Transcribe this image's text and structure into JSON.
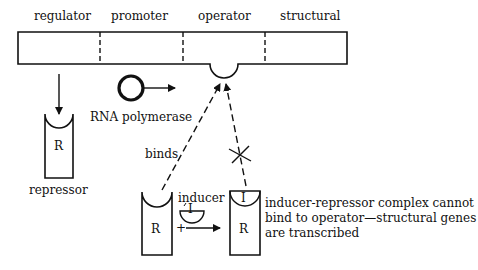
{
  "diagram": {
    "type": "lac-operon-induction",
    "gene_segments": [
      "regulator",
      "promoter",
      "operator",
      "structural"
    ],
    "labels": {
      "rna_polymerase": "RNA polymerase",
      "repressor": "repressor",
      "repressor_symbol": "R",
      "repressor_symbol_2": "R",
      "repressor_symbol_3": "R",
      "inducer": "inducer",
      "inducer_symbol": "I",
      "inducer_symbol_bound": "I",
      "binds": "binds",
      "plus": "+",
      "note_line1": "inducer-repressor complex cannot",
      "note_line2": "bind to operator—structural genes",
      "note_line3": "are transcribed"
    },
    "colors": {
      "stroke": "#111111",
      "background": "#ffffff"
    }
  }
}
